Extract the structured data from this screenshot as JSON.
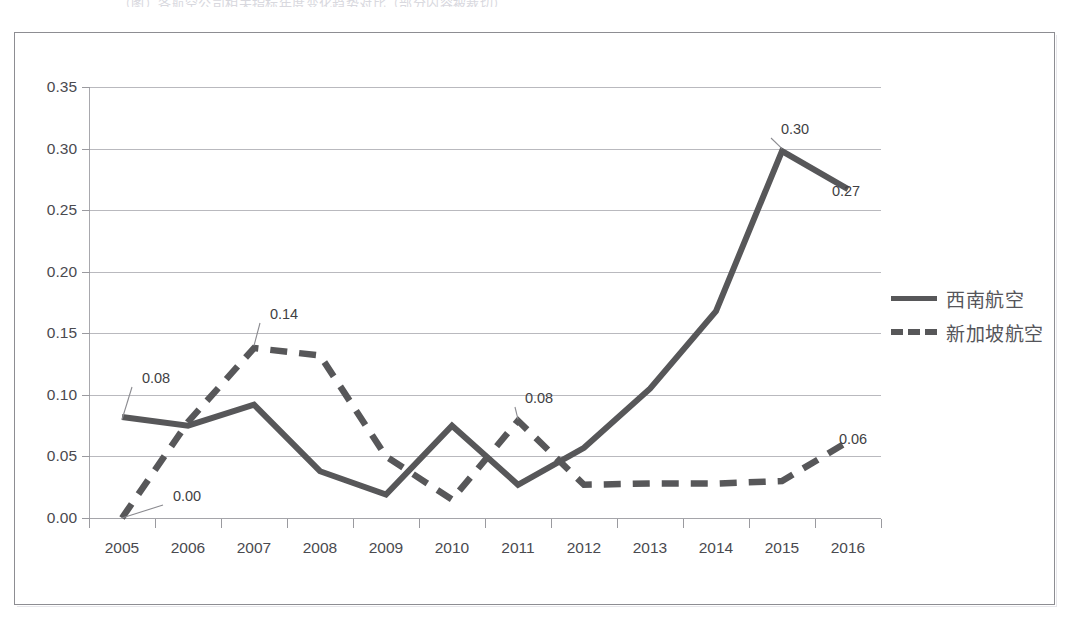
{
  "caption_sliver": "（图）各航空公司相关指标年度变化趋势对比（部分内容被裁切）",
  "legend": {
    "position": "right",
    "items": [
      {
        "label": "西南航空",
        "style": "solid",
        "color": "#575759"
      },
      {
        "label": "新加坡航空",
        "style": "dashed",
        "color": "#575759"
      }
    ]
  },
  "axes": {
    "y_ticks": [
      "0.00",
      "0.05",
      "0.10",
      "0.15",
      "0.20",
      "0.25",
      "0.30",
      "0.35"
    ],
    "x_ticks": [
      "2005",
      "2006",
      "2007",
      "2008",
      "2009",
      "2010",
      "2011",
      "2012",
      "2013",
      "2014",
      "2015",
      "2016"
    ]
  },
  "annotations": [
    {
      "text": "0.08",
      "series": "西南航空",
      "x": "2005",
      "value": 0.08,
      "px": 155,
      "py": 377,
      "leader": true
    },
    {
      "text": "0.00",
      "series": "新加坡航空",
      "x": "2005",
      "value": 0.0,
      "px": 186,
      "py": 495,
      "leader": true
    },
    {
      "text": "0.14",
      "series": "新加坡航空",
      "x": "2007",
      "value": 0.14,
      "px": 283,
      "py": 313,
      "leader": true
    },
    {
      "text": "0.08",
      "series": "新加坡航空",
      "x": "2011",
      "value": 0.08,
      "px": 538,
      "py": 397,
      "leader": true
    },
    {
      "text": "0.30",
      "series": "西南航空",
      "x": "2015",
      "value": 0.3,
      "px": 794,
      "py": 128,
      "leader": true
    },
    {
      "text": "0.27",
      "series": "西南航空",
      "x": "2016",
      "value": 0.27,
      "px": 845,
      "py": 190,
      "leader": false
    },
    {
      "text": "0.06",
      "series": "新加坡航空",
      "x": "2016",
      "value": 0.06,
      "px": 852,
      "py": 438,
      "leader": false
    }
  ],
  "chart_data": {
    "type": "line",
    "title": "",
    "subtitle": "",
    "xlabel": "",
    "ylabel": "",
    "grid": true,
    "legend_position": "right",
    "ylim": [
      0.0,
      0.35
    ],
    "ytick_step": 0.05,
    "categories": [
      "2005",
      "2006",
      "2007",
      "2008",
      "2009",
      "2010",
      "2011",
      "2012",
      "2013",
      "2014",
      "2015",
      "2016"
    ],
    "series": [
      {
        "name": "西南航空",
        "style": "solid",
        "color": "#575759",
        "values": [
          0.082,
          0.075,
          0.092,
          0.038,
          0.019,
          0.075,
          0.027,
          0.057,
          0.105,
          0.168,
          0.298,
          0.267
        ],
        "labeled_points": {
          "2005": 0.08,
          "2015": 0.3,
          "2016": 0.27
        }
      },
      {
        "name": "新加坡航空",
        "style": "dashed",
        "color": "#575759",
        "values": [
          0.0,
          0.078,
          0.138,
          0.132,
          0.05,
          0.015,
          0.079,
          0.027,
          0.028,
          0.028,
          0.03,
          0.062
        ],
        "labeled_points": {
          "2005": 0.0,
          "2007": 0.14,
          "2011": 0.08,
          "2016": 0.06
        }
      }
    ]
  }
}
